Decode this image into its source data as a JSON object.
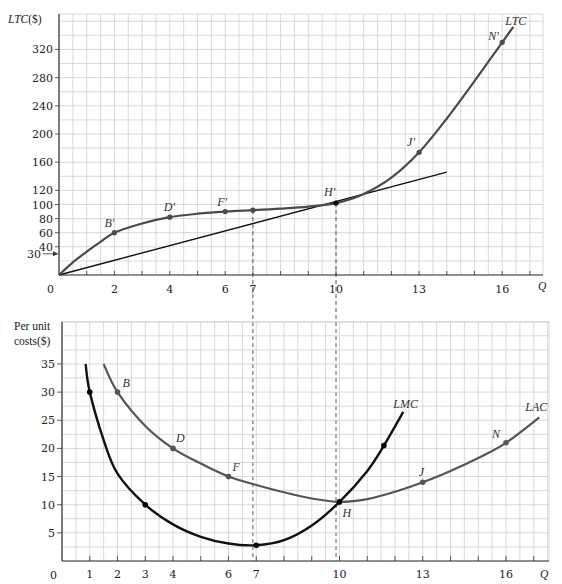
{
  "chart_data": [
    {
      "type": "line",
      "title": "Long-run total cost",
      "xlabel": "Q",
      "ylabel": "LTC($)",
      "x_ticks": [
        2,
        4,
        6,
        7,
        10,
        13,
        16
      ],
      "y_ticks": [
        40,
        60,
        80,
        100,
        120,
        160,
        200,
        240,
        280,
        320
      ],
      "y_marker": {
        "value": 30,
        "label": "30"
      },
      "origin_label": "0",
      "xlim": [
        0,
        17.5
      ],
      "ylim": [
        0,
        370
      ],
      "grid": true,
      "series": [
        {
          "name": "LTC",
          "label": "LTC",
          "x": [
            0,
            0.5,
            1,
            1.5,
            2,
            3,
            4,
            5,
            6,
            7,
            8,
            9,
            10,
            11,
            12,
            13,
            14,
            15,
            16,
            16.4
          ],
          "y": [
            0,
            18,
            33,
            47,
            60,
            73,
            82,
            87,
            90,
            92,
            94,
            97,
            102,
            115,
            138,
            174,
            222,
            275,
            330,
            352
          ]
        },
        {
          "name": "ray",
          "label": "",
          "x": [
            0,
            14
          ],
          "y": [
            0,
            146
          ]
        }
      ],
      "points": [
        {
          "label": "B'",
          "x": 2,
          "y": 60
        },
        {
          "label": "D'",
          "x": 4,
          "y": 82
        },
        {
          "label": "F'",
          "x": 6,
          "y": 90
        },
        {
          "label": "",
          "x": 7,
          "y": 92
        },
        {
          "label": "H'",
          "x": 10,
          "y": 102
        },
        {
          "label": "J'",
          "x": 13,
          "y": 174
        },
        {
          "label": "N'",
          "x": 16,
          "y": 330
        }
      ]
    },
    {
      "type": "line",
      "title": "Per unit costs",
      "xlabel": "Q",
      "ylabel": "Per unit costs($)",
      "ylabel_lines": [
        "Per unit",
        "costs($)"
      ],
      "x_ticks": [
        1,
        2,
        3,
        4,
        6,
        7,
        10,
        13,
        16
      ],
      "y_ticks": [
        5,
        10,
        15,
        20,
        25,
        30,
        35
      ],
      "origin_label": "0",
      "xlim": [
        0,
        17.5
      ],
      "ylim": [
        0,
        42
      ],
      "grid": true,
      "series": [
        {
          "name": "LAC",
          "label": "LAC",
          "x": [
            1.5,
            2,
            3,
            4,
            5,
            6,
            7,
            8,
            9,
            10,
            11,
            12,
            13,
            14,
            15,
            16,
            17.2
          ],
          "y": [
            35,
            30,
            24,
            20,
            17.3,
            15,
            13.5,
            12.2,
            11.1,
            10.5,
            11,
            12.3,
            14,
            16,
            18.3,
            21,
            25.5
          ]
        },
        {
          "name": "LMC",
          "label": "LMC",
          "x": [
            0.85,
            1,
            1.5,
            2,
            3,
            4,
            5,
            6,
            7,
            8,
            9,
            10,
            11,
            11.6,
            12.3
          ],
          "y": [
            35,
            30,
            21.5,
            15.5,
            10,
            6.5,
            4.3,
            3.1,
            2.8,
            3.7,
            6.3,
            10.5,
            16,
            20.5,
            26.5
          ]
        }
      ],
      "points": [
        {
          "label": "B",
          "x": 2,
          "y": 30,
          "series": "LAC"
        },
        {
          "label": "D",
          "x": 4,
          "y": 20,
          "series": "LAC"
        },
        {
          "label": "F",
          "x": 6,
          "y": 15,
          "series": "LAC"
        },
        {
          "label": "H",
          "x": 10,
          "y": 10.5,
          "series": "LAC"
        },
        {
          "label": "J",
          "x": 13,
          "y": 14,
          "series": "LAC"
        },
        {
          "label": "N",
          "x": 16,
          "y": 21,
          "series": "LAC"
        },
        {
          "label": "",
          "x": 1,
          "y": 30,
          "series": "LMC"
        },
        {
          "label": "",
          "x": 3,
          "y": 10,
          "series": "LMC"
        },
        {
          "label": "",
          "x": 7,
          "y": 2.8,
          "series": "LMC"
        },
        {
          "label": "",
          "x": 11.6,
          "y": 20.5,
          "series": "LMC"
        }
      ]
    }
  ],
  "connectors": [
    {
      "q": 7,
      "label": "7"
    },
    {
      "q": 10,
      "label": "10"
    }
  ],
  "colors": {
    "ltc_curve": "#4a4a4a",
    "lac_curve": "#555555",
    "lmc_curve": "#111111",
    "ray": "#111111",
    "grid": "#c9c9c9",
    "axis": "#333333"
  }
}
